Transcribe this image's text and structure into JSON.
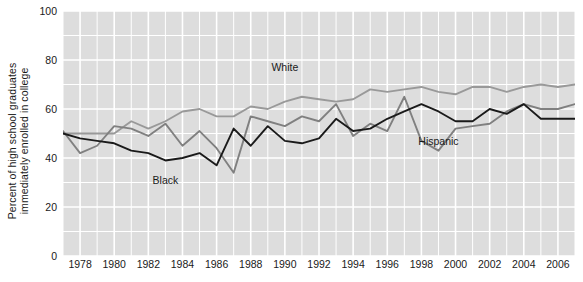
{
  "chart_data": {
    "type": "line",
    "title": "",
    "xlabel": "",
    "ylabel_line1": "Percent of high school graduates",
    "ylabel_line2": "immediately enrolled in college",
    "ylim": [
      0,
      100
    ],
    "yticks": [
      0,
      20,
      40,
      60,
      80,
      100
    ],
    "ytick_labels": [
      "0",
      "20",
      "40",
      "60",
      "80",
      "100"
    ],
    "xlim": [
      1977,
      2007
    ],
    "xticks": [
      1978,
      1980,
      1982,
      1984,
      1986,
      1988,
      1990,
      1992,
      1994,
      1996,
      1998,
      2000,
      2002,
      2004,
      2006
    ],
    "xtick_labels": [
      "1978",
      "1980",
      "1982",
      "1984",
      "1986",
      "1988",
      "1990",
      "1992",
      "1994",
      "1996",
      "1998",
      "2000",
      "2002",
      "2004",
      "2006"
    ],
    "grid": true,
    "grid_color": "#ffffff",
    "plot_background": "#dddddd",
    "legend": "inline-labels",
    "x": [
      1977,
      1978,
      1979,
      1980,
      1981,
      1982,
      1983,
      1984,
      1985,
      1986,
      1987,
      1988,
      1989,
      1990,
      1991,
      1992,
      1993,
      1994,
      1995,
      1996,
      1997,
      1998,
      1999,
      2000,
      2001,
      2002,
      2003,
      2004,
      2005,
      2006,
      2007
    ],
    "series": [
      {
        "name": "White",
        "color": "#999999",
        "label_x": 1990,
        "label_y": 77,
        "values": [
          50,
          50,
          50,
          50,
          55,
          52,
          55,
          59,
          60,
          57,
          57,
          61,
          60,
          63,
          65,
          64,
          63,
          64,
          68,
          67,
          68,
          69,
          67,
          66,
          69,
          69,
          67,
          69,
          70,
          69,
          70
        ]
      },
      {
        "name": "Black",
        "color": "#1a1a1a",
        "label_x": 1983,
        "label_y": 31,
        "values": [
          50,
          48,
          47,
          46,
          43,
          42,
          39,
          40,
          42,
          37,
          52,
          45,
          53,
          47,
          46,
          48,
          56,
          51,
          52,
          56,
          59,
          62,
          59,
          55,
          55,
          60,
          58,
          62,
          56,
          56,
          56
        ]
      },
      {
        "name": "Hispanic",
        "color": "#808080",
        "label_x": 1999,
        "label_y": 47,
        "values": [
          51,
          42,
          45,
          53,
          52,
          49,
          54,
          45,
          51,
          44,
          34,
          57,
          55,
          53,
          57,
          55,
          62,
          49,
          54,
          51,
          65,
          47,
          43,
          52,
          53,
          54,
          59,
          62,
          60,
          60,
          62
        ]
      }
    ]
  },
  "axis": {
    "y_label_l1": "Percent of high school graduates",
    "y_label_l2": "immediately enrolled in college"
  }
}
